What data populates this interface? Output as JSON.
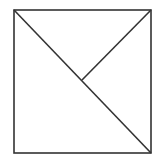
{
  "diagram": {
    "background": "#ffffff",
    "stroke_color": "#333333",
    "stroke_width": 1.6,
    "square": {
      "x1": 14,
      "y1": 10,
      "x2": 151,
      "y2": 153
    },
    "lines": [
      {
        "name": "main-diagonal",
        "x1": 14,
        "y1": 10,
        "x2": 151,
        "y2": 153
      },
      {
        "name": "partial-diagonal",
        "x1": 151,
        "y1": 10,
        "x2": 82,
        "y2": 80
      }
    ]
  }
}
